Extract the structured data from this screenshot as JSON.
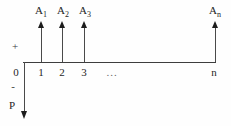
{
  "diagram": {
    "kind": "cash-flow-diagram",
    "plus_sign": "+",
    "minus_sign": "-",
    "present_value_label": "P",
    "ellipsis": "...",
    "upper_labels": [
      {
        "base": "A",
        "sub": "1"
      },
      {
        "base": "A",
        "sub": "2"
      },
      {
        "base": "A",
        "sub": "3"
      },
      {
        "base": "A",
        "sub": "n"
      }
    ],
    "tick_labels": [
      "0",
      "1",
      "2",
      "3",
      "n"
    ]
  }
}
